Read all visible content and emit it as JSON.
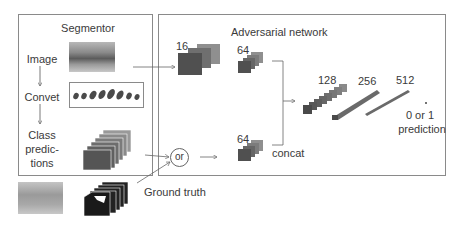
{
  "segmentor": {
    "title": "Segmentor",
    "steps": [
      "Image",
      "Convet",
      "Class",
      "predic-",
      "tions"
    ]
  },
  "adversarial": {
    "title": "Adversarial network",
    "layers": {
      "image_branch": "16",
      "image_branch_2": "64",
      "label_branch": "64",
      "concat_1": "128",
      "concat_2": "256",
      "concat_3": "512"
    },
    "concat_label": "concat",
    "or_label": "or",
    "output_line1": "0 or 1",
    "output_line2": "prediction"
  },
  "ground_truth_label": "Ground truth",
  "colors": {
    "border": "#8a8a8a",
    "feature_dark": "#555555",
    "feature_mid": "#777777",
    "feature_light": "#8f8f8f",
    "arrow": "#666666"
  }
}
